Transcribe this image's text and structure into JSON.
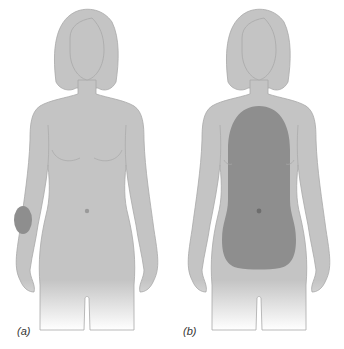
{
  "figure": {
    "panels": [
      {
        "label": "(a)",
        "subject": "female front silhouette",
        "highlight_region": "small patch on right forearm (viewer's left)"
      },
      {
        "label": "(b)",
        "subject": "female front silhouette",
        "highlight_region": "large area covering chest and abdomen"
      }
    ],
    "colors": {
      "body_fill": "#c4c4c4",
      "body_outline": "#a8a8a8",
      "highlight_fill": "#8e8e8e",
      "navel": "#9a9a9a",
      "background": "#ffffff",
      "caption": "#333333"
    }
  }
}
